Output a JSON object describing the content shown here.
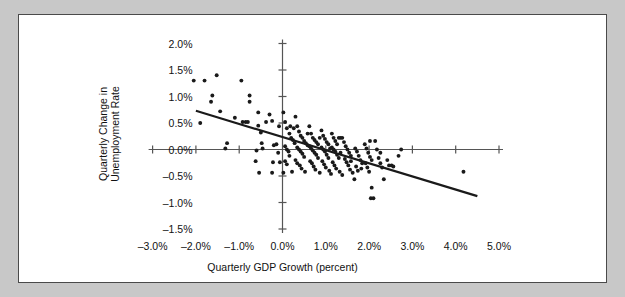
{
  "figure": {
    "background_color": "#c8c8c8",
    "panel_color": "#ffffff",
    "border_color": "#4a4a4a",
    "ink_color": "#1a1a1a"
  },
  "chart_data": {
    "type": "scatter",
    "title": "",
    "xlabel": "Quarterly GDP Growth (percent)",
    "ylabel_line1": "Quarterly Change in",
    "ylabel_line2": "Unemployment Rate",
    "xlim": [
      -3.0,
      5.0
    ],
    "ylim": [
      -1.5,
      2.0
    ],
    "grid": false,
    "legend": "none",
    "xticks": [
      -3.0,
      -2.0,
      -1.0,
      0.0,
      1.0,
      2.0,
      3.0,
      4.0,
      5.0
    ],
    "xtick_labels": [
      "-3.0%",
      "-2.0%",
      "-1.0%",
      "0.0%",
      "1.0%",
      "2.0%",
      "3.0%",
      "4.0%",
      "5.0%"
    ],
    "yticks": [
      2.0,
      1.5,
      1.0,
      0.5,
      0.0,
      -0.5,
      -1.0,
      -1.5
    ],
    "ytick_labels": [
      "2.0%",
      "1.5%",
      "1.0%",
      "0.5%",
      "0.0%",
      "-0.5%",
      "-1.0%",
      "-1.5%"
    ],
    "axis_cross_x": 0.0,
    "axis_cross_y": 0.0,
    "trendline": {
      "label": "fitted regression line",
      "x_start": -2.0,
      "y_start": 0.73,
      "x_end": 4.5,
      "y_end": -0.88
    },
    "points": [
      [
        -2.05,
        1.3
      ],
      [
        -1.8,
        1.3
      ],
      [
        -1.52,
        1.4
      ],
      [
        -0.95,
        1.3
      ],
      [
        -1.62,
        1.02
      ],
      [
        -1.65,
        0.9
      ],
      [
        -0.76,
        1.02
      ],
      [
        -0.76,
        0.9
      ],
      [
        -1.44,
        0.72
      ],
      [
        -1.1,
        0.6
      ],
      [
        -0.92,
        0.52
      ],
      [
        -0.85,
        0.52
      ],
      [
        -0.8,
        0.52
      ],
      [
        -1.9,
        0.5
      ],
      [
        -0.56,
        0.7
      ],
      [
        -0.56,
        0.45
      ],
      [
        -0.3,
        0.66
      ],
      [
        -0.24,
        0.54
      ],
      [
        -0.08,
        0.44
      ],
      [
        -0.5,
        0.32
      ],
      [
        -0.48,
        0.12
      ],
      [
        -0.46,
        0.02
      ],
      [
        -1.28,
        0.12
      ],
      [
        -1.32,
        0.02
      ],
      [
        -0.6,
        -0.02
      ],
      [
        -0.62,
        -0.22
      ],
      [
        -0.54,
        -0.44
      ],
      [
        -0.24,
        -0.44
      ],
      [
        -0.22,
        -0.24
      ],
      [
        -0.2,
        0.08
      ],
      [
        -0.14,
        0.1
      ],
      [
        -0.1,
        -0.06
      ],
      [
        -0.06,
        -0.24
      ],
      [
        0.02,
        0.7
      ],
      [
        0.06,
        0.52
      ],
      [
        0.1,
        0.4
      ],
      [
        0.16,
        0.3
      ],
      [
        0.2,
        0.22
      ],
      [
        0.24,
        0.18
      ],
      [
        0.28,
        0.12
      ],
      [
        0.06,
        0.06
      ],
      [
        0.1,
        0.0
      ],
      [
        0.14,
        -0.04
      ],
      [
        0.16,
        -0.12
      ],
      [
        0.06,
        -0.22
      ],
      [
        0.1,
        -0.28
      ],
      [
        0.02,
        -0.44
      ],
      [
        0.22,
        -0.42
      ],
      [
        0.3,
        0.62
      ],
      [
        0.34,
        0.44
      ],
      [
        0.38,
        0.34
      ],
      [
        0.42,
        0.26
      ],
      [
        0.46,
        0.22
      ],
      [
        0.5,
        0.16
      ],
      [
        0.54,
        0.12
      ],
      [
        0.58,
        0.08
      ],
      [
        0.34,
        0.04
      ],
      [
        0.38,
        0.0
      ],
      [
        0.42,
        -0.04
      ],
      [
        0.46,
        -0.08
      ],
      [
        0.5,
        -0.14
      ],
      [
        0.3,
        -0.2
      ],
      [
        0.34,
        -0.26
      ],
      [
        0.4,
        -0.3
      ],
      [
        0.44,
        -0.36
      ],
      [
        0.52,
        -0.42
      ],
      [
        0.62,
        0.44
      ],
      [
        0.66,
        0.3
      ],
      [
        0.7,
        0.22
      ],
      [
        0.74,
        0.18
      ],
      [
        0.78,
        0.14
      ],
      [
        0.82,
        0.1
      ],
      [
        0.62,
        0.06
      ],
      [
        0.66,
        0.02
      ],
      [
        0.7,
        -0.02
      ],
      [
        0.74,
        -0.06
      ],
      [
        0.78,
        -0.1
      ],
      [
        0.82,
        -0.16
      ],
      [
        0.64,
        -0.22
      ],
      [
        0.68,
        -0.26
      ],
      [
        0.72,
        -0.32
      ],
      [
        0.76,
        -0.38
      ],
      [
        0.86,
        -0.44
      ],
      [
        0.9,
        0.36
      ],
      [
        0.94,
        0.26
      ],
      [
        0.98,
        0.2
      ],
      [
        1.02,
        0.14
      ],
      [
        1.06,
        0.1
      ],
      [
        0.9,
        0.04
      ],
      [
        0.94,
        0.0
      ],
      [
        0.98,
        -0.04
      ],
      [
        1.02,
        -0.1
      ],
      [
        1.06,
        -0.16
      ],
      [
        0.92,
        -0.22
      ],
      [
        0.96,
        -0.28
      ],
      [
        1.0,
        -0.34
      ],
      [
        1.08,
        -0.4
      ],
      [
        1.12,
        -0.46
      ],
      [
        1.14,
        0.3
      ],
      [
        1.18,
        0.22
      ],
      [
        1.22,
        0.16
      ],
      [
        1.26,
        0.1
      ],
      [
        1.3,
        0.22
      ],
      [
        1.34,
        0.22
      ],
      [
        1.14,
        0.04
      ],
      [
        1.18,
        0.0
      ],
      [
        1.22,
        -0.04
      ],
      [
        1.26,
        -0.1
      ],
      [
        1.3,
        -0.16
      ],
      [
        1.16,
        -0.24
      ],
      [
        1.2,
        -0.3
      ],
      [
        1.24,
        -0.36
      ],
      [
        1.32,
        -0.42
      ],
      [
        1.38,
        -0.48
      ],
      [
        1.42,
        0.14
      ],
      [
        1.46,
        0.06
      ],
      [
        1.5,
        0.0
      ],
      [
        1.54,
        -0.06
      ],
      [
        1.58,
        -0.12
      ],
      [
        1.44,
        -0.18
      ],
      [
        1.48,
        -0.24
      ],
      [
        1.52,
        -0.3
      ],
      [
        1.56,
        -0.38
      ],
      [
        1.62,
        -0.44
      ],
      [
        1.68,
        0.02
      ],
      [
        1.72,
        -0.04
      ],
      [
        1.76,
        -0.12
      ],
      [
        1.8,
        -0.2
      ],
      [
        1.84,
        -0.26
      ],
      [
        1.7,
        -0.32
      ],
      [
        1.74,
        -0.4
      ],
      [
        1.66,
        -0.56
      ],
      [
        1.9,
        0.1
      ],
      [
        1.94,
        0.02
      ],
      [
        1.98,
        -0.06
      ],
      [
        2.02,
        -0.14
      ],
      [
        2.06,
        -0.2
      ],
      [
        1.92,
        -0.26
      ],
      [
        1.96,
        -0.34
      ],
      [
        2.0,
        -0.42
      ],
      [
        2.04,
        -0.92
      ],
      [
        2.1,
        -0.92
      ],
      [
        2.06,
        -0.72
      ],
      [
        2.14,
        0.16
      ],
      [
        2.18,
        0.0
      ],
      [
        2.22,
        -0.16
      ],
      [
        2.26,
        -0.26
      ],
      [
        2.3,
        -0.34
      ],
      [
        2.34,
        -0.56
      ],
      [
        2.42,
        -0.2
      ],
      [
        2.46,
        -0.3
      ],
      [
        2.52,
        -0.3
      ],
      [
        2.56,
        -0.32
      ],
      [
        2.68,
        -0.12
      ],
      [
        2.74,
        0.0
      ],
      [
        1.38,
        0.22
      ],
      [
        4.18,
        -0.42
      ],
      [
        0.18,
        0.44
      ],
      [
        0.26,
        0.4
      ],
      [
        -0.38,
        0.52
      ],
      [
        0.58,
        0.3
      ],
      [
        0.86,
        0.22
      ],
      [
        1.1,
        0.02
      ],
      [
        1.34,
        -0.06
      ],
      [
        1.58,
        -0.22
      ],
      [
        1.82,
        -0.36
      ],
      [
        2.02,
        0.16
      ],
      [
        2.26,
        -0.06
      ]
    ]
  }
}
